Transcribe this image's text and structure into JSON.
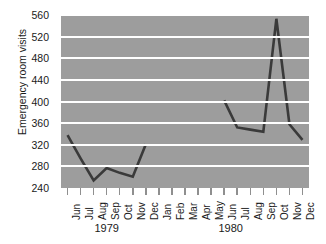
{
  "chart_data": {
    "type": "line",
    "title": "",
    "xlabel": "",
    "ylabel": "Emergency room visits",
    "ylim": [
      240,
      560
    ],
    "ytick_values": [
      240,
      280,
      320,
      360,
      400,
      440,
      480,
      520,
      560
    ],
    "grid": true,
    "legend": "none",
    "line_color": "#3a3a3a",
    "plot_background": "#9d9d9d",
    "gridline_color": "#ffffff",
    "categories": [
      "Jun",
      "Jul",
      "Aug",
      "Sep",
      "Oct",
      "Nov",
      "Dec",
      "Jan",
      "Feb",
      "Mar",
      "Apr",
      "May",
      "Jun",
      "Jul",
      "Aug",
      "Sep",
      "Oct",
      "Nov",
      "Dec"
    ],
    "year_groups": [
      {
        "label": "1979",
        "start_index": 0,
        "end_index": 6
      },
      {
        "label": "1980",
        "start_index": 7,
        "end_index": 18
      }
    ],
    "values": [
      338,
      295,
      254,
      277,
      268,
      261,
      321,
      null,
      null,
      null,
      null,
      null,
      402,
      352,
      348,
      344,
      553,
      358,
      329
    ],
    "series": [
      {
        "name": "Emergency room visits",
        "values": [
          338,
          295,
          254,
          277,
          268,
          261,
          321,
          null,
          null,
          null,
          null,
          null,
          402,
          352,
          348,
          344,
          553,
          358,
          329
        ]
      }
    ],
    "annotations": [
      "Data gap from Jan 1980 through May 1980",
      "Peak of 553 visits in Oct 1980"
    ]
  }
}
